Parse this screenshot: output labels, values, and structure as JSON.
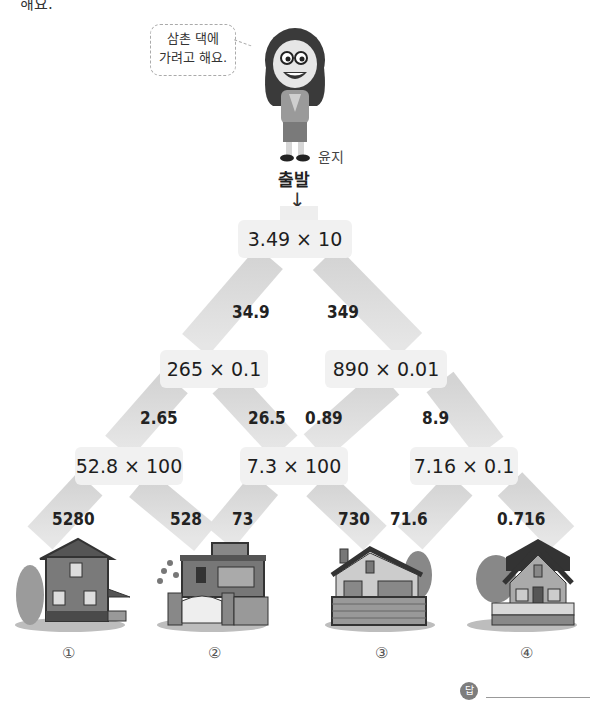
{
  "header": {
    "partial_text": "해요."
  },
  "character": {
    "speech": "삼촌 댁에\n가려고 해요.",
    "speech_line1": "삼촌 댁에",
    "speech_line2": "가려고 해요.",
    "name": "윤지"
  },
  "start": {
    "label": "출발",
    "arrow": "↓"
  },
  "tree": {
    "level0": [
      {
        "expr": "3.49 × 10",
        "left": "34.9",
        "right": "349"
      }
    ],
    "level1": [
      {
        "expr": "265 × 0.1",
        "left": "2.65",
        "right": "26.5"
      },
      {
        "expr": "890 × 0.01",
        "left": "0.89",
        "right": "8.9"
      }
    ],
    "level2": [
      {
        "expr": "52.8 × 100",
        "left": "5280",
        "right": "528"
      },
      {
        "expr": "7.3 × 100",
        "left": "73",
        "right": "730"
      },
      {
        "expr": "7.16 × 0.1",
        "left": "71.6",
        "right": "0.716"
      }
    ]
  },
  "houses": [
    {
      "number": "①"
    },
    {
      "number": "②"
    },
    {
      "number": "③"
    },
    {
      "number": "④"
    }
  ],
  "answer": {
    "icon_label": "답",
    "value": ""
  },
  "colors": {
    "path": "#d6d6d6",
    "node_bg": "#f1f1f1",
    "text": "#222222"
  }
}
